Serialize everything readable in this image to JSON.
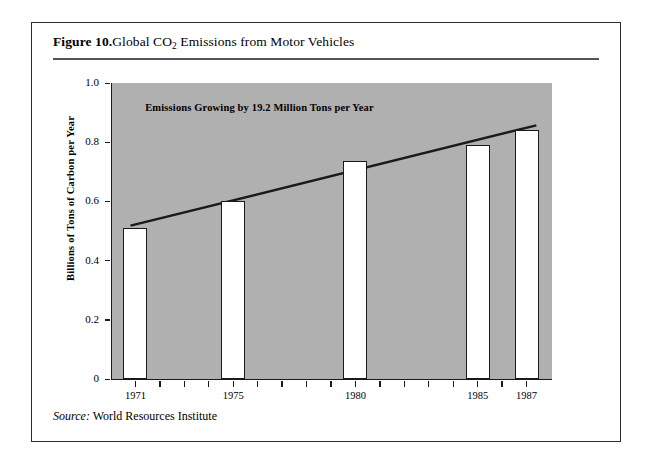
{
  "figure": {
    "number": "Figure 10.",
    "title_before": "Global CO",
    "title_sub": "2",
    "title_after": " Emissions from Motor Vehicles",
    "source_label": "Source:",
    "source_text": "World Resources Institute"
  },
  "chart_data": {
    "type": "bar",
    "title": "Global CO2 Emissions from Motor Vehicles",
    "xlabel": "",
    "ylabel": "Billions of Tons of Carbon per Year",
    "categories": [
      "1971",
      "1975",
      "1980",
      "1985",
      "1987"
    ],
    "values": [
      0.51,
      0.6,
      0.735,
      0.79,
      0.84
    ],
    "ylim": [
      0,
      1.0
    ],
    "xlim": [
      1970,
      1988
    ],
    "ytick_labels": [
      "0",
      "0.2",
      "0.4",
      "0.6",
      "0.8",
      "1.0"
    ],
    "ytick_values": [
      0,
      0.2,
      0.4,
      0.6,
      0.8,
      1.0
    ],
    "xtick_years": [
      1971,
      1972,
      1973,
      1974,
      1975,
      1976,
      1977,
      1978,
      1979,
      1980,
      1981,
      1982,
      1983,
      1984,
      1985,
      1986,
      1987
    ],
    "xtick_labeled": [
      "1971",
      "1975",
      "1980",
      "1985",
      "1987"
    ],
    "grid": false,
    "legend": "none",
    "plot_background": "#b0b0b0",
    "bar_fill": "#ffffff",
    "bar_edge": "#1a1a1a",
    "annotations": [
      {
        "text": "Emissions Growing by 19.2 Million Tons per Year",
        "x": 1971.4,
        "y": 0.915
      }
    ],
    "trend_line": {
      "label": "linear trend",
      "slope_per_year": 0.0192,
      "x_start": 1970.8,
      "y_start": 0.518,
      "x_end": 1987.4,
      "y_end": 0.857,
      "color": "#1a1a1a"
    }
  }
}
